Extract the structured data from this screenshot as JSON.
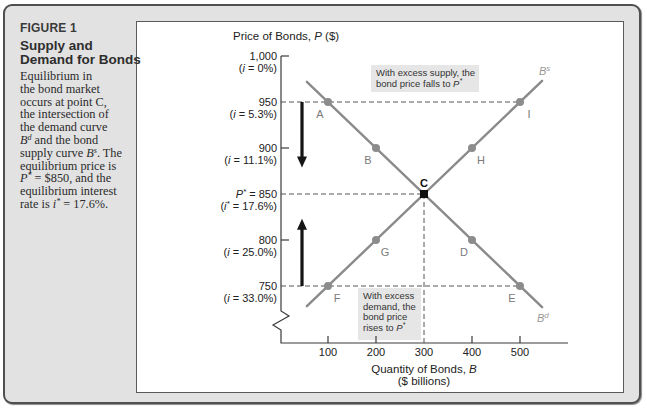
{
  "figure": {
    "number": "FIGURE 1",
    "title_lines": [
      "Supply and",
      "Demand for Bonds"
    ],
    "description_lines": [
      [
        {
          "t": "Equilibrium in"
        }
      ],
      [
        {
          "t": "the bond market"
        }
      ],
      [
        {
          "t": "occurs at point C,"
        }
      ],
      [
        {
          "t": "the intersection of"
        }
      ],
      [
        {
          "t": "the demand curve"
        }
      ],
      [
        {
          "t": "B",
          "i": true,
          "sup": "d"
        },
        {
          "t": " and the bond"
        }
      ],
      [
        {
          "t": "supply curve "
        },
        {
          "t": "B",
          "i": true,
          "sup": "s"
        },
        {
          "t": ". The"
        }
      ],
      [
        {
          "t": "equilibrium price is"
        }
      ],
      [
        {
          "t": "P",
          "i": true,
          "sup": "*"
        },
        {
          "t": " = $850, and the"
        }
      ],
      [
        {
          "t": "equilibrium interest"
        }
      ],
      [
        {
          "t": "rate is "
        },
        {
          "t": "i",
          "i": true,
          "sup": "*"
        },
        {
          "t": " = 17.6%."
        }
      ]
    ]
  },
  "chart_data": {
    "type": "line",
    "title": "Supply and Demand for Bonds",
    "ylabel": [
      {
        "t": "Price of Bonds, "
      },
      {
        "t": "P",
        "i": true
      },
      {
        "t": " ($)"
      }
    ],
    "xlabel_lines": [
      [
        {
          "t": "Quantity of Bonds, "
        },
        {
          "t": "B",
          "i": true
        }
      ],
      [
        {
          "t": "($ billions)"
        }
      ]
    ],
    "xlim": [
      0,
      550
    ],
    "ylim": [
      700,
      1000
    ],
    "y_axis_break": true,
    "grid": false,
    "x_ticks": [
      {
        "value": 100,
        "label": "100"
      },
      {
        "value": 200,
        "label": "200"
      },
      {
        "value": 300,
        "label": "300"
      },
      {
        "value": 400,
        "label": "400"
      },
      {
        "value": 500,
        "label": "500"
      }
    ],
    "y_ticks": [
      {
        "value": 1000,
        "label": "1,000",
        "rate": "0%",
        "mark": true
      },
      {
        "value": 950,
        "label": "950",
        "rate": "5.3%",
        "mark": false
      },
      {
        "value": 900,
        "label": "900",
        "rate": "11.1%",
        "mark": true
      },
      {
        "value": 850,
        "label": "850",
        "rate": "17.6%",
        "mark": false,
        "equilibrium": true,
        "symbol": "P",
        "rate_symbol": "i"
      },
      {
        "value": 800,
        "label": "800",
        "rate": "25.0%",
        "mark": true
      },
      {
        "value": 750,
        "label": "750",
        "rate": "33.0%",
        "mark": false
      }
    ],
    "series": [
      {
        "name": "B^d",
        "label": "B",
        "sup": "d",
        "description": "Demand curve",
        "line_from": [
          56,
          972
        ],
        "line_to": [
          546,
          727
        ],
        "label_at": [
          543,
          318
        ],
        "points": [
          {
            "id": "A",
            "x": 100,
            "y": 950,
            "pos": "bl"
          },
          {
            "id": "B",
            "x": 200,
            "y": 900,
            "pos": "bl"
          },
          {
            "id": "C",
            "x": 300,
            "y": 850,
            "pos": "top"
          },
          {
            "id": "D",
            "x": 400,
            "y": 800,
            "pos": "bl"
          },
          {
            "id": "E",
            "x": 500,
            "y": 750,
            "pos": "bl"
          }
        ]
      },
      {
        "name": "B^s",
        "label": "B",
        "sup": "s",
        "description": "Supply curve",
        "line_from": [
          56,
          728
        ],
        "line_to": [
          546,
          973
        ],
        "label_at": [
          545,
          71
        ],
        "points": [
          {
            "id": "F",
            "x": 100,
            "y": 750,
            "pos": "br"
          },
          {
            "id": "G",
            "x": 200,
            "y": 800,
            "pos": "br"
          },
          {
            "id": "H",
            "x": 400,
            "y": 900,
            "pos": "br"
          },
          {
            "id": "I",
            "x": 500,
            "y": 950,
            "pos": "br"
          }
        ]
      }
    ],
    "equilibrium": {
      "point": "C",
      "quantity": 300,
      "price": 850,
      "interest_rate": "17.6%"
    },
    "guides": [
      {
        "type": "h",
        "price": 950,
        "to_quantity": 500
      },
      {
        "type": "h",
        "price": 850,
        "to_quantity": 300
      },
      {
        "type": "h",
        "price": 750,
        "to_quantity": 500
      },
      {
        "type": "v",
        "quantity": 300,
        "from_price": 850
      }
    ],
    "arrows": [
      {
        "direction": "down",
        "quantity": 46,
        "from_price": 950,
        "to_price": 880,
        "meaning": "price falls to P*"
      },
      {
        "direction": "up",
        "quantity": 46,
        "from_price": 750,
        "to_price": 822,
        "meaning": "price rises to P*"
      }
    ],
    "annotations": [
      {
        "name": "excess-supply-note",
        "box": [
          371,
          65,
          108,
          27
        ],
        "lines": [
          [
            {
              "t": "With excess supply, the"
            }
          ],
          [
            {
              "t": "bond price falls to "
            },
            {
              "t": "P",
              "i": true,
              "sup": "*"
            }
          ]
        ]
      },
      {
        "name": "excess-demand-note",
        "box": [
          358,
          288,
          63,
          52
        ],
        "lines": [
          [
            {
              "t": "With excess"
            }
          ],
          [
            {
              "t": "demand, the"
            }
          ],
          [
            {
              "t": "bond price"
            }
          ],
          [
            {
              "t": "rises to "
            },
            {
              "t": "P",
              "i": true,
              "sup": "*"
            }
          ]
        ]
      }
    ],
    "colors": {
      "curve": "#8a8a8a",
      "point": "#8c8c8c",
      "equilibrium_point": "#111111",
      "point_label": "#7a7a7a",
      "axis": "#3a3a3a",
      "guide": "#555555",
      "arrow": "#151515",
      "note_bg": "#e6e6e6"
    }
  }
}
